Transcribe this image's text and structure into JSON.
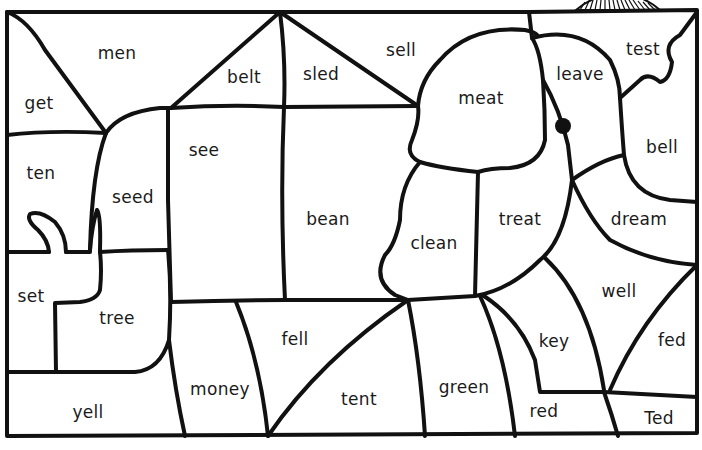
{
  "worksheet": {
    "type": "color-by-word puzzle",
    "regions": [
      {
        "id": "men",
        "label": "men",
        "x": 117,
        "y": 53
      },
      {
        "id": "get",
        "label": "get",
        "x": 39,
        "y": 103
      },
      {
        "id": "belt",
        "label": "belt",
        "x": 244,
        "y": 77
      },
      {
        "id": "sled",
        "label": "sled",
        "x": 321,
        "y": 74
      },
      {
        "id": "sell",
        "label": "sell",
        "x": 401,
        "y": 50
      },
      {
        "id": "meat",
        "label": "meat",
        "x": 481,
        "y": 98
      },
      {
        "id": "leave",
        "label": "leave",
        "x": 580,
        "y": 74
      },
      {
        "id": "test",
        "label": "test",
        "x": 643,
        "y": 49
      },
      {
        "id": "bell",
        "label": "bell",
        "x": 662,
        "y": 147
      },
      {
        "id": "ten",
        "label": "ten",
        "x": 41,
        "y": 173
      },
      {
        "id": "seed",
        "label": "seed",
        "x": 133,
        "y": 197
      },
      {
        "id": "see",
        "label": "see",
        "x": 204,
        "y": 150
      },
      {
        "id": "bean",
        "label": "bean",
        "x": 328,
        "y": 219
      },
      {
        "id": "clean",
        "label": "clean",
        "x": 434,
        "y": 243
      },
      {
        "id": "treat",
        "label": "treat",
        "x": 520,
        "y": 219
      },
      {
        "id": "dream",
        "label": "dream",
        "x": 639,
        "y": 219
      },
      {
        "id": "set",
        "label": "set",
        "x": 31,
        "y": 296
      },
      {
        "id": "tree",
        "label": "tree",
        "x": 117,
        "y": 318
      },
      {
        "id": "well",
        "label": "well",
        "x": 619,
        "y": 291
      },
      {
        "id": "fell",
        "label": "fell",
        "x": 295,
        "y": 339
      },
      {
        "id": "key",
        "label": "key",
        "x": 554,
        "y": 341
      },
      {
        "id": "fed",
        "label": "fed",
        "x": 672,
        "y": 340
      },
      {
        "id": "money",
        "label": "money",
        "x": 220,
        "y": 389
      },
      {
        "id": "tent",
        "label": "tent",
        "x": 359,
        "y": 399
      },
      {
        "id": "green",
        "label": "green",
        "x": 464,
        "y": 387
      },
      {
        "id": "yell",
        "label": "yell",
        "x": 88,
        "y": 412
      },
      {
        "id": "red",
        "label": "red",
        "x": 544,
        "y": 411
      },
      {
        "id": "Ted",
        "label": "Ted",
        "x": 659,
        "y": 418
      }
    ]
  },
  "colors": {
    "line": "#111111",
    "background": "#ffffff",
    "eye": "#111111"
  }
}
